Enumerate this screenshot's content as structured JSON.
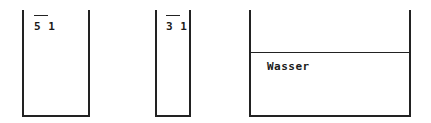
{
  "vessels": [
    {
      "id": "vessel-1",
      "label": "5 1",
      "label_overlined_part": "5",
      "contents": ""
    },
    {
      "id": "vessel-2",
      "label": "3 1",
      "label_overlined_part": "3",
      "contents": ""
    },
    {
      "id": "vessel-3",
      "label": "",
      "contents": "Wasser"
    }
  ],
  "colors": {
    "stroke": "#222222",
    "background": "#ffffff"
  }
}
